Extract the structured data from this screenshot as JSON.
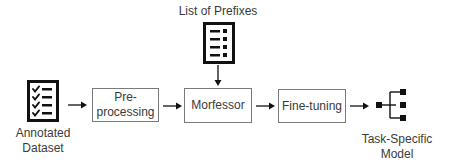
{
  "diagram": {
    "type": "flowchart",
    "nodes": [
      {
        "id": "annotated_dataset",
        "label_line1": "Annotated",
        "label_line2": "Dataset",
        "icon": "checklist-icon"
      },
      {
        "id": "preprocessing",
        "label_line1": "Pre-",
        "label_line2": "processing"
      },
      {
        "id": "morfessor",
        "label": "Morfessor"
      },
      {
        "id": "fine_tuning",
        "label": "Fine-tuning"
      },
      {
        "id": "task_model",
        "label_line1": "Task-Specific",
        "label_line2": "Model",
        "icon": "hierarchy-tree-icon"
      },
      {
        "id": "prefix_list",
        "label": "List of Prefixes",
        "icon": "list-document-icon"
      }
    ],
    "edges": [
      {
        "from": "annotated_dataset",
        "to": "preprocessing"
      },
      {
        "from": "preprocessing",
        "to": "morfessor"
      },
      {
        "from": "prefix_list",
        "to": "morfessor"
      },
      {
        "from": "morfessor",
        "to": "fine_tuning"
      },
      {
        "from": "fine_tuning",
        "to": "task_model"
      }
    ]
  },
  "colors": {
    "stroke": "#111111",
    "box_border": "#7a7a7a",
    "text": "#3a3a3a"
  }
}
